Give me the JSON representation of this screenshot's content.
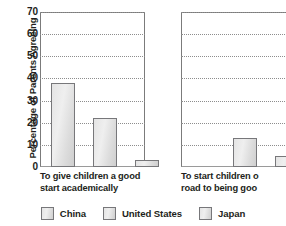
{
  "chart_data": {
    "type": "bar",
    "title": "",
    "subtitle": "",
    "xlabel": "",
    "ylabel": "Percentage of Parents Agreeing",
    "ylim": [
      0,
      70
    ],
    "yticks": [
      0,
      10,
      20,
      30,
      40,
      50,
      60,
      70
    ],
    "ytick_labels": [
      "0",
      "10",
      "20",
      "30",
      "40",
      "50",
      "60",
      "70"
    ],
    "grid": true,
    "grid_style": "dotted-horizontal",
    "legend_position": "bottom-center",
    "categories": [
      "To give children a good start academically",
      "To start children on the road to being good"
    ],
    "category_labels_wrapped": [
      [
        "To give children a good",
        "start academically"
      ],
      [
        "To start children o",
        "road to being goo"
      ]
    ],
    "note": "Second panel is cropped by the right edge of the screenshot; its Japan bar and the end of its label are not visible.",
    "series": [
      {
        "name": "China",
        "values": [
          38,
          13
        ]
      },
      {
        "name": "United States",
        "values": [
          22,
          5
        ]
      },
      {
        "name": "Japan",
        "values": [
          3,
          null
        ]
      }
    ],
    "colors": {
      "bar_fill": "#e6e6e6",
      "bar_border": "#77777a",
      "gridline": "#8d8d8d",
      "axis": "#7b7b7b",
      "text": "#231f20",
      "background": "#ffffff"
    }
  },
  "legend": {
    "items": [
      {
        "label": "China"
      },
      {
        "label": "United States"
      },
      {
        "label": "Japan"
      }
    ]
  }
}
